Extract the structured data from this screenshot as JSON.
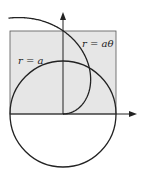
{
  "diagram": {
    "type": "polar-curves",
    "labels": {
      "spiral": "r = aθ",
      "circle": "r = a"
    },
    "colors": {
      "shade": "#e6e6e6",
      "stroke": "#222222",
      "background": "#ffffff"
    },
    "geometry": {
      "origin": [
        63,
        114
      ],
      "a_pixels": 53,
      "shaded_rect": [
        10,
        31,
        116,
        114
      ]
    }
  }
}
